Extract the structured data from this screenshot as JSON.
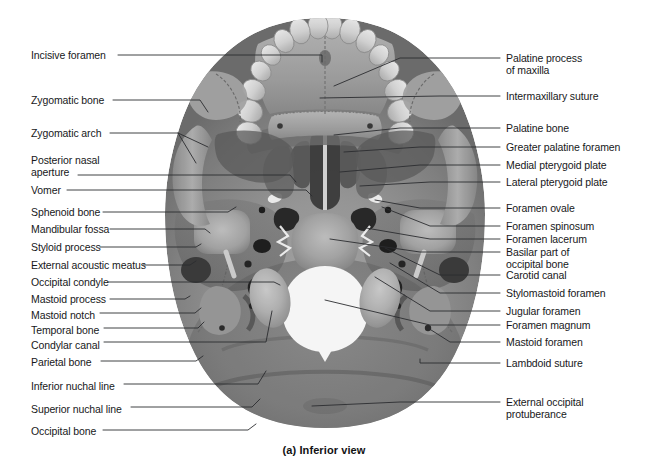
{
  "figure": {
    "caption": "(a) Inferior view",
    "background_color": "#ffffff",
    "line_color": "#2b2d30",
    "text_color": "#17181a"
  },
  "labels_left": [
    {
      "id": "incisive-foramen",
      "text": "Incisive foramen",
      "x": 31,
      "y": 50
    },
    {
      "id": "zygomatic-bone",
      "text": "Zygomatic bone",
      "x": 31,
      "y": 95
    },
    {
      "id": "zygomatic-arch",
      "text": "Zygomatic arch",
      "x": 31,
      "y": 128
    },
    {
      "id": "posterior-nasal-aperture",
      "text": "Posterior nasal\naperture",
      "x": 31,
      "y": 155
    },
    {
      "id": "vomer",
      "text": "Vomer",
      "x": 31,
      "y": 185
    },
    {
      "id": "sphenoid-bone",
      "text": "Sphenoid bone",
      "x": 31,
      "y": 207
    },
    {
      "id": "mandibular-fossa",
      "text": "Mandibular fossa",
      "x": 31,
      "y": 224
    },
    {
      "id": "styloid-process",
      "text": "Styloid process",
      "x": 31,
      "y": 242
    },
    {
      "id": "external-acoustic-meatus",
      "text": "External acoustic meatus",
      "x": 31,
      "y": 260
    },
    {
      "id": "occipital-condyle",
      "text": "Occipital condyle",
      "x": 31,
      "y": 277
    },
    {
      "id": "mastoid-process",
      "text": "Mastoid process",
      "x": 31,
      "y": 294
    },
    {
      "id": "mastoid-notch",
      "text": "Mastoid notch",
      "x": 31,
      "y": 310
    },
    {
      "id": "temporal-bone",
      "text": "Temporal bone",
      "x": 31,
      "y": 325
    },
    {
      "id": "condylar-canal",
      "text": "Condylar canal",
      "x": 31,
      "y": 340
    },
    {
      "id": "parietal-bone",
      "text": "Parietal bone",
      "x": 31,
      "y": 357
    },
    {
      "id": "inferior-nuchal-line",
      "text": "Inferior nuchal line",
      "x": 31,
      "y": 381
    },
    {
      "id": "superior-nuchal-line",
      "text": "Superior nuchal line",
      "x": 31,
      "y": 404
    },
    {
      "id": "occipital-bone",
      "text": "Occipital bone",
      "x": 31,
      "y": 426
    }
  ],
  "labels_right": [
    {
      "id": "palatine-process-of-maxilla",
      "text": "Palatine process\nof maxilla",
      "x": 506,
      "y": 53
    },
    {
      "id": "intermaxillary-suture",
      "text": "Intermaxillary suture",
      "x": 506,
      "y": 91
    },
    {
      "id": "palatine-bone",
      "text": "Palatine bone",
      "x": 506,
      "y": 123
    },
    {
      "id": "greater-palatine-foramen",
      "text": "Greater palatine foramen",
      "x": 506,
      "y": 142
    },
    {
      "id": "medial-pterygoid-plate",
      "text": "Medial pterygoid plate",
      "x": 506,
      "y": 160
    },
    {
      "id": "lateral-pterygoid-plate",
      "text": "Lateral pterygoid plate",
      "x": 506,
      "y": 177
    },
    {
      "id": "foramen-ovale",
      "text": "Foramen ovale",
      "x": 506,
      "y": 203
    },
    {
      "id": "foramen-spinosum",
      "text": "Foramen spinosum",
      "x": 506,
      "y": 221
    },
    {
      "id": "foramen-lacerum",
      "text": "Foramen lacerum",
      "x": 506,
      "y": 234
    },
    {
      "id": "basilar-part-of-occipital-bone",
      "text": "Basilar part of\noccipital bone",
      "x": 506,
      "y": 247
    },
    {
      "id": "carotid-canal",
      "text": "Carotid canal",
      "x": 506,
      "y": 270
    },
    {
      "id": "stylomastoid-foramen",
      "text": "Stylomastoid foramen",
      "x": 506,
      "y": 288
    },
    {
      "id": "jugular-foramen",
      "text": "Jugular foramen",
      "x": 506,
      "y": 306
    },
    {
      "id": "foramen-magnum",
      "text": "Foramen magnum",
      "x": 506,
      "y": 320
    },
    {
      "id": "mastoid-foramen",
      "text": "Mastoid foramen",
      "x": 506,
      "y": 337
    },
    {
      "id": "lambdoid-suture",
      "text": "Lambdoid suture",
      "x": 506,
      "y": 358
    },
    {
      "id": "external-occipital-protuberance",
      "text": "External occipital\nprotuberance",
      "x": 506,
      "y": 397
    }
  ],
  "leaders_left": [
    {
      "id": "incisive-foramen",
      "points": "118,55 322,55 322,62"
    },
    {
      "id": "zygomatic-bone",
      "points": "113,100 200,100 208,112"
    },
    {
      "id": "zygomatic-arch",
      "points": "110,133 178,133 196,163"
    },
    {
      "id": "zygomatic-arch-branch",
      "points": "178,133 208,147"
    },
    {
      "id": "posterior-nasal-aperture",
      "text_anchor": "aperture",
      "points": "78,175 290,175 296,182"
    },
    {
      "id": "vomer",
      "points": "67,190 306,190 312,196"
    },
    {
      "id": "sphenoid-bone",
      "points": "103,212 228,212 236,207"
    },
    {
      "id": "mandibular-fossa",
      "points": "110,229 205,229 210,233"
    },
    {
      "id": "styloid-process",
      "points": "100,247 196,247 201,244"
    },
    {
      "id": "external-acoustic-meatus",
      "points": "143,265 190,265 196,261"
    },
    {
      "id": "occipital-condyle",
      "points": "108,282 274,282 280,285"
    },
    {
      "id": "mastoid-process",
      "points": "110,299 185,299 190,296"
    },
    {
      "id": "mastoid-notch",
      "points": "100,313 195,313 201,308"
    },
    {
      "id": "temporal-bone",
      "points": "104,328 198,328 204,322"
    },
    {
      "id": "condylar-canal",
      "points": "104,342 266,342 272,311"
    },
    {
      "id": "parietal-bone",
      "points": "101,361 196,361 203,356"
    },
    {
      "id": "inferior-nuchal-line",
      "points": "124,384 258,384 266,371"
    },
    {
      "id": "superior-nuchal-line",
      "points": "131,407 252,407 260,399"
    },
    {
      "id": "occipital-bone",
      "points": "103,430 248,430 256,424"
    }
  ],
  "leaders_right": [
    {
      "id": "palatine-process-of-maxilla",
      "points": "500,58 400,58 334,86"
    },
    {
      "id": "intermaxillary-suture",
      "points": "500,96 440,96 320,98"
    },
    {
      "id": "palatine-bone",
      "points": "500,128 400,128 334,135"
    },
    {
      "id": "greater-palatine-foramen",
      "points": "500,147 420,147 344,152"
    },
    {
      "id": "medial-pterygoid-plate",
      "points": "500,165 420,165 340,172"
    },
    {
      "id": "lateral-pterygoid-plate",
      "points": "500,182 430,182 360,186"
    },
    {
      "id": "foramen-ovale",
      "points": "500,208 420,208 375,200"
    },
    {
      "id": "foramen-spinosum",
      "points": "500,226 430,226 382,207"
    },
    {
      "id": "foramen-lacerum",
      "points": "500,239 430,239 366,228"
    },
    {
      "id": "basilar-part-of-occipital-bone",
      "points": "500,252 420,252 330,239"
    },
    {
      "id": "carotid-canal",
      "points": "500,275 440,275 385,248"
    },
    {
      "id": "stylomastoid-foramen",
      "points": "500,293 440,293 390,263"
    },
    {
      "id": "jugular-foramen",
      "points": "500,311 430,311 375,277"
    },
    {
      "id": "foramen-magnum",
      "points": "500,325 430,325 325,300"
    },
    {
      "id": "mastoid-foramen",
      "points": "500,342 450,342 428,328"
    },
    {
      "id": "lambdoid-suture",
      "points": "500,363 420,363 420,359"
    },
    {
      "id": "external-occipital-protuberance",
      "points": "500,402 400,402 312,406"
    }
  ],
  "anatomy_regions": [
    {
      "id": "foramen-magnum-opening",
      "kind": "aperture"
    },
    {
      "id": "occipital-condyle-left",
      "kind": "process"
    },
    {
      "id": "occipital-condyle-right",
      "kind": "process"
    },
    {
      "id": "maxillary-teeth",
      "kind": "dentition"
    },
    {
      "id": "hard-palate",
      "kind": "plate"
    },
    {
      "id": "zygomatic-arch-left",
      "kind": "arch"
    },
    {
      "id": "zygomatic-arch-right",
      "kind": "arch"
    },
    {
      "id": "occipital-squama",
      "kind": "plate"
    }
  ]
}
